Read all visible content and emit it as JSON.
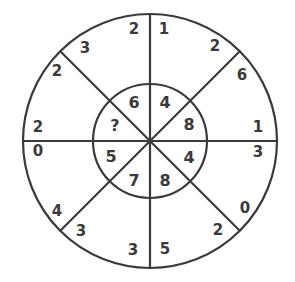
{
  "puzzle": {
    "type": "number-wheel",
    "colors": {
      "line": "#3a3a3a",
      "text": "#3a3a3a",
      "background": "#ffffff"
    },
    "inner": [
      {
        "label": "6",
        "x": 134,
        "y": 102
      },
      {
        "label": "4",
        "x": 165,
        "y": 102
      },
      {
        "label": "8",
        "x": 189,
        "y": 124
      },
      {
        "label": "4",
        "x": 189,
        "y": 157
      },
      {
        "label": "8",
        "x": 165,
        "y": 180
      },
      {
        "label": "7",
        "x": 134,
        "y": 180
      },
      {
        "label": "5",
        "x": 111,
        "y": 156
      },
      {
        "label": "?",
        "x": 115,
        "y": 125
      }
    ],
    "outer": [
      {
        "label": "2",
        "x": 134,
        "y": 29
      },
      {
        "label": "1",
        "x": 164,
        "y": 29
      },
      {
        "label": "2",
        "x": 215,
        "y": 46
      },
      {
        "label": "6",
        "x": 242,
        "y": 75
      },
      {
        "label": "1",
        "x": 258,
        "y": 127
      },
      {
        "label": "3",
        "x": 258,
        "y": 152
      },
      {
        "label": "0",
        "x": 245,
        "y": 208
      },
      {
        "label": "2",
        "x": 218,
        "y": 230
      },
      {
        "label": "5",
        "x": 165,
        "y": 249
      },
      {
        "label": "3",
        "x": 133,
        "y": 250
      },
      {
        "label": "3",
        "x": 81,
        "y": 231
      },
      {
        "label": "4",
        "x": 57,
        "y": 211
      },
      {
        "label": "0",
        "x": 38,
        "y": 151
      },
      {
        "label": "2",
        "x": 38,
        "y": 127
      },
      {
        "label": "2",
        "x": 57,
        "y": 71
      },
      {
        "label": "3",
        "x": 85,
        "y": 48
      }
    ]
  }
}
